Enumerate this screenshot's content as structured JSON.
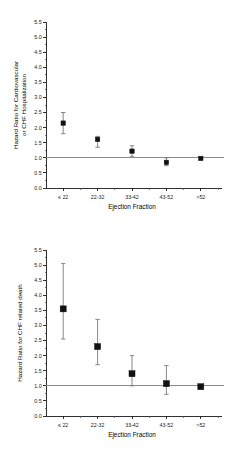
{
  "figure": {
    "background_color": "#ffffff",
    "marker_color": "#111111",
    "whisker_color": "#7a7a7a",
    "reference_line_color": "#8c8c8c",
    "axis_color": "#1a1a1a"
  },
  "chart_data": [
    {
      "type": "scatter",
      "panel": "top",
      "title": "",
      "xlabel": "Ejection Fraction",
      "ylabel_lines": [
        "Hazard Ratio for Cardiovascular",
        "or CHF Hospitalization"
      ],
      "ylabel": "Hazard Ratio for Cardiovascular or CHF Hospitalization",
      "categories": [
        "≤ 22",
        "22-32",
        "33-42",
        "43-52",
        ">52"
      ],
      "values": [
        2.15,
        1.61,
        1.22,
        0.85,
        0.98
      ],
      "ci_low": [
        1.8,
        1.35,
        1.05,
        0.74,
        null
      ],
      "ci_high": [
        2.5,
        1.71,
        1.4,
        1.0,
        null
      ],
      "ylim": [
        0.0,
        5.5
      ],
      "ytick_labels": [
        "0.0",
        "0.5",
        "1.0",
        "1.5",
        "2.0",
        "2.5",
        "3.0",
        "3.5",
        "4.0",
        "4.5",
        "5.0",
        "5.5"
      ],
      "ytick_values": [
        0.0,
        0.5,
        1.0,
        1.5,
        2.0,
        2.5,
        3.0,
        3.5,
        4.0,
        4.5,
        5.0,
        5.5
      ],
      "reference_line": 1.0,
      "grid": false,
      "legend": "none",
      "minor_ticks": true
    },
    {
      "type": "scatter",
      "panel": "bottom",
      "title": "",
      "xlabel": "Ejection Fraction",
      "ylabel_lines": [
        "Hazard Ratio for CHF related death"
      ],
      "ylabel": "Hazard Ratio for CHF related death",
      "categories": [
        "≤ 22",
        "22-32",
        "33-42",
        "43-52",
        ">52"
      ],
      "values": [
        3.55,
        2.3,
        1.4,
        1.07,
        0.97
      ],
      "ci_low": [
        2.55,
        1.7,
        1.0,
        0.72,
        null
      ],
      "ci_high": [
        5.05,
        3.2,
        2.0,
        1.67,
        null
      ],
      "ylim": [
        0.0,
        5.5
      ],
      "ytick_labels": [
        "0.0",
        "0.5",
        "1.0",
        "1.5",
        "2.0",
        "2.5",
        "3.0",
        "3.5",
        "4.0",
        "4.5",
        "5.0",
        "5.5"
      ],
      "ytick_values": [
        0.0,
        0.5,
        1.0,
        1.5,
        2.0,
        2.5,
        3.0,
        3.5,
        4.0,
        4.5,
        5.0,
        5.5
      ],
      "reference_line": 1.0,
      "grid": false,
      "legend": "none",
      "minor_ticks": true
    }
  ]
}
